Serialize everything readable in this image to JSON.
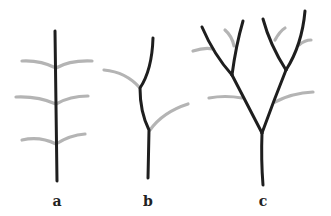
{
  "figure": {
    "panels": [
      {
        "id": "a",
        "label": "a",
        "description": "Single unbranched stem with three pairs of lateral leaves"
      },
      {
        "id": "b",
        "label": "b",
        "description": "Sympodial zig-zag stem with two alternating leaves"
      },
      {
        "id": "c",
        "label": "c",
        "description": "Dichotomously branching stem with leaves at branch points"
      }
    ],
    "colors": {
      "stem": "#1e1e1e",
      "leaf": "#b4b4b4",
      "background": "#ffffff"
    }
  }
}
